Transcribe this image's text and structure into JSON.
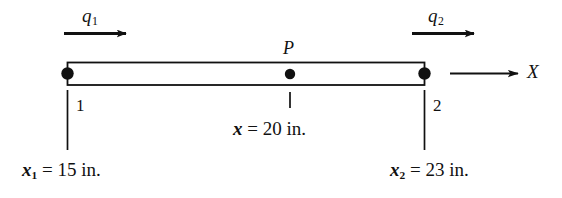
{
  "figure": {
    "background_color": "#ffffff",
    "line_color": "#111111"
  },
  "beam": {
    "name": "bar-element",
    "fill_color": "#ffffff",
    "stroke_color": "#111111"
  },
  "nodes": [
    {
      "id": "1",
      "label": "1",
      "position": "left-end"
    },
    {
      "id": "2",
      "label": "2",
      "position": "right-end"
    }
  ],
  "interior_point": {
    "label": "P",
    "description": "interior point on bar"
  },
  "loads": [
    {
      "name": "q1",
      "label": "q",
      "subscript": "1",
      "direction": "right"
    },
    {
      "name": "q2",
      "label": "q",
      "subscript": "2",
      "direction": "right"
    }
  ],
  "axis": {
    "label": "X",
    "direction": "right"
  },
  "dimensions": [
    {
      "name": "x1",
      "variable": "x",
      "subscript": "1",
      "equals": "=",
      "value": "15",
      "unit": "in.",
      "text": "x1 = 15 in."
    },
    {
      "name": "x",
      "variable": "x",
      "subscript": "",
      "equals": "=",
      "value": "20",
      "unit": "in.",
      "text": "x = 20 in."
    },
    {
      "name": "x2",
      "variable": "x",
      "subscript": "2",
      "equals": "=",
      "value": "23",
      "unit": "in.",
      "text": "x2 = 23 in."
    }
  ]
}
